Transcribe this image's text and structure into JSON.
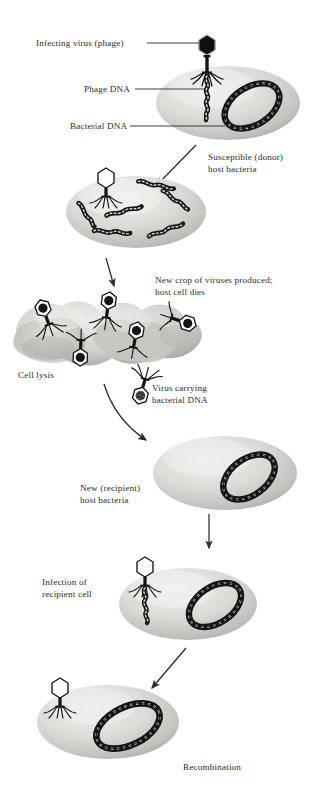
{
  "figure": {
    "type": "biological-process-diagram",
    "background_color": "#ffffff",
    "ink_color": "#2b2b2b",
    "cell_fill_light": "#e4e4e2",
    "cell_fill_mid": "#c9c9c6",
    "cell_fill_dark": "#a9a9a5"
  },
  "labels": {
    "infecting_virus": "Infecting virus (phage)",
    "phage_dna": "Phage DNA",
    "bacterial_dna": "Bacterial DNA",
    "susceptible_donor": "Susceptible (donor)\nhost bacteria",
    "new_crop": "New crop of viruses produced;\nhost cell dies",
    "cell_lysis": "Cell lysis",
    "virus_carrying": "Virus carrying\nbacterial DNA",
    "new_recipient": "New (recipient)\nhost bacteria",
    "infection_recipient": "Infection of\nrecipient cell",
    "recombination": "Recombination"
  },
  "stages": [
    {
      "id": "stage-1-donor-infection",
      "name": "Susceptible (donor) host bacteria",
      "contents": [
        "infecting phage with dark head",
        "phage DNA injected",
        "circular bacterial DNA"
      ]
    },
    {
      "id": "stage-2-dna-fragmented",
      "name": "Phage replication and host DNA fragmentation",
      "contents": [
        "empty phage head",
        "five bacterial DNA fragments"
      ]
    },
    {
      "id": "stage-3-cell-lysis",
      "name": "Cell lysis",
      "contents": [
        "lysed irregular cell mass",
        "five new phages with dark heads"
      ]
    },
    {
      "id": "stage-4-new-recipient",
      "name": "New (recipient) host bacteria",
      "contents": [
        "circular bacterial DNA"
      ]
    },
    {
      "id": "stage-5-infection-of-recipient",
      "name": "Infection of recipient cell",
      "contents": [
        "phage with empty head injecting DNA",
        "circular bacterial DNA"
      ]
    },
    {
      "id": "stage-6-recombination",
      "name": "Recombination",
      "contents": [
        "phage with empty head attached",
        "recombined circular bacterial DNA"
      ]
    }
  ],
  "transduction_carrier": {
    "name": "Virus carrying bacterial DNA",
    "head_fill": "speckled-dark"
  },
  "arrows": [
    {
      "from": "stage-1-donor-infection",
      "to": "stage-2-dna-fragmented"
    },
    {
      "from": "stage-2-dna-fragmented",
      "to": "stage-3-cell-lysis"
    },
    {
      "from": "stage-3-cell-lysis",
      "to": "stage-4-new-recipient"
    },
    {
      "from": "stage-4-new-recipient",
      "to": "stage-5-infection-of-recipient"
    },
    {
      "from": "stage-5-infection-of-recipient",
      "to": "stage-6-recombination"
    }
  ]
}
